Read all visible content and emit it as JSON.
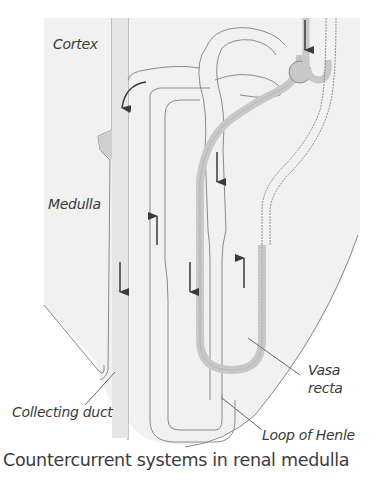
{
  "diagram": {
    "title": "Countercurrent systems in renal medulla",
    "regions": {
      "cortex": "Cortex",
      "medulla": "Medulla"
    },
    "labels": {
      "collecting_duct": "Collecting duct",
      "vasa_recta_line1": "Vasa",
      "vasa_recta_line2": "recta",
      "loop_of_henle": "Loop of Henle"
    },
    "structures": [
      {
        "name": "Collecting duct",
        "flow": "down"
      },
      {
        "name": "Loop of Henle (descending limb)",
        "flow": "down"
      },
      {
        "name": "Loop of Henle (ascending limb)",
        "flow": "up"
      },
      {
        "name": "Vasa recta (descending)",
        "flow": "down"
      },
      {
        "name": "Vasa recta (ascending)",
        "flow": "up"
      }
    ],
    "colors": {
      "tissue_fill": "#f1f1f1",
      "outline": "#8a8a8a",
      "vessel_fill": "#c8c8c8",
      "arrow": "#3a3a3a",
      "text": "#3a3a3a"
    }
  }
}
